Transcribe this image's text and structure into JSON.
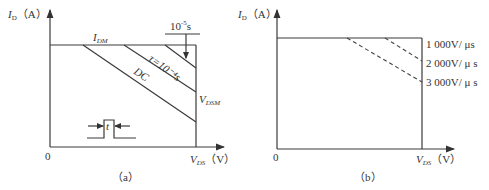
{
  "panel_a": {
    "caption": "（a）",
    "y_axis_label": {
      "var": "I",
      "sub": "D",
      "unit": "（A）"
    },
    "x_axis_label": {
      "var": "V",
      "sub": "DS",
      "unit": "（V）"
    },
    "origin": "0",
    "idm_label": {
      "var": "I",
      "sub": "DM"
    },
    "vdsm_label": {
      "var": "V",
      "sub": "DSM"
    },
    "top_time_label": {
      "base": "10",
      "exp": "-5",
      "unit": "s"
    },
    "tau_label": "τ=10⁻⁴s",
    "dc_label": "DC",
    "pulse_label": "t"
  },
  "panel_b": {
    "caption": "（b）",
    "y_axis_label": {
      "var": "I",
      "sub": "D",
      "unit": "（A）"
    },
    "x_axis_label": {
      "var": "V",
      "sub": "DS",
      "unit": "（V）"
    },
    "origin": "0",
    "curve_labels": [
      "1 000V/ μs",
      "2 000V/ μ s",
      "3 000V/ μ s"
    ]
  }
}
